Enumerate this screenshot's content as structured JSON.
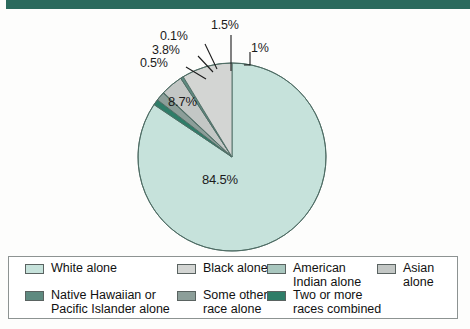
{
  "header": {
    "bar_color": "#2b6a5d"
  },
  "chart_data": {
    "type": "pie",
    "title": "",
    "unit": "percent",
    "start_angle_deg": 0,
    "direction": "clockwise",
    "categories": [
      "White alone",
      "Two or more races combined",
      "Some other race alone",
      "American Indian alone",
      "Asian alone",
      "Native Hawaiian or Pacific Islander alone",
      "Black alone"
    ],
    "values": [
      84.5,
      1,
      1.5,
      0.1,
      3.8,
      0.5,
      8.7
    ],
    "labels": [
      "84.5%",
      "1%",
      "1.5%",
      "0.1%",
      "3.8%",
      "0.5%",
      "8.7%"
    ],
    "colors": [
      "#c6e2db",
      "#2e7d68",
      "#8c9e99",
      "#a9c7bf",
      "#c3c7c5",
      "#5e8a80",
      "#d3d5d3"
    ],
    "legend_position": "bottom",
    "grid": false
  },
  "pie_labels": {
    "white": "84.5%",
    "black": "8.7%",
    "native_hawaiian": "0.5%",
    "asian": "3.8%",
    "american_indian": "0.1%",
    "some_other": "1.5%",
    "two_or_more": "1%"
  },
  "legend": {
    "rows": [
      [
        {
          "label": "White alone",
          "color": "#c6e2db",
          "name": "white-alone"
        },
        {
          "label": "Black alone",
          "color": "#d3d5d3",
          "name": "black-alone"
        },
        {
          "label": "American\nIndian alone",
          "color": "#a9c7bf",
          "name": "american-indian-alone"
        },
        {
          "label": "Asian alone",
          "color": "#c3c7c5",
          "name": "asian-alone"
        }
      ],
      [
        {
          "label": "Native Hawaiian or\nPacific Islander alone",
          "color": "#5e8a80",
          "name": "native-hawaiian-pacific-islander-alone"
        },
        {
          "label": "Some other\nrace alone",
          "color": "#8c9e99",
          "name": "some-other-race-alone"
        },
        {
          "label": "Two or more\nraces combined",
          "color": "#2e7d68",
          "name": "two-or-more-races-combined"
        }
      ]
    ]
  }
}
